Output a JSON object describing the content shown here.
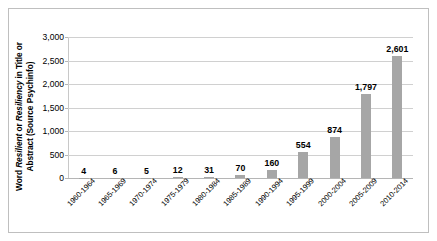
{
  "chart_data": {
    "type": "bar",
    "title": "",
    "xlabel": "",
    "ylabel": "Word Resilient or Resiliency in Title or Abstract (Source Psychinfo)",
    "ylabel_parts": [
      {
        "text": "Word ",
        "style": "normal"
      },
      {
        "text": "Resilient",
        "style": "italic"
      },
      {
        "text": " or ",
        "style": "normal"
      },
      {
        "text": "Resiliency",
        "style": "italic"
      },
      {
        "text": " in Title or Abstract (Source Psychinfo)",
        "style": "normal"
      }
    ],
    "categories": [
      "1960-1964",
      "1965-1969",
      "1970-1974",
      "1975-1979",
      "1980-1984",
      "1985-1989",
      "1990-1994",
      "1995-1999",
      "2000-2004",
      "2005-2009",
      "2010-2014"
    ],
    "values": [
      4,
      6,
      5,
      12,
      31,
      70,
      160,
      554,
      874,
      1797,
      2601
    ],
    "value_labels": [
      "4",
      "6",
      "5",
      "12",
      "31",
      "70",
      "160",
      "554",
      "874",
      "1,797",
      "2,601"
    ],
    "ylim": [
      0,
      3000
    ],
    "ytick_values": [
      0,
      500,
      1000,
      1500,
      2000,
      2500,
      3000
    ],
    "ytick_labels": [
      "0",
      "500",
      "1,000",
      "1,500",
      "2,000",
      "2,500",
      "3,000"
    ],
    "grid": true,
    "legend": false,
    "legend_position": "none",
    "bar_color": "#a6a6a6",
    "gridline_color": "#d0d0d0",
    "axis_color": "#b5b5b5",
    "text_color": "#000000",
    "background_color": "#ffffff",
    "border_color": "#bfbfbf"
  }
}
